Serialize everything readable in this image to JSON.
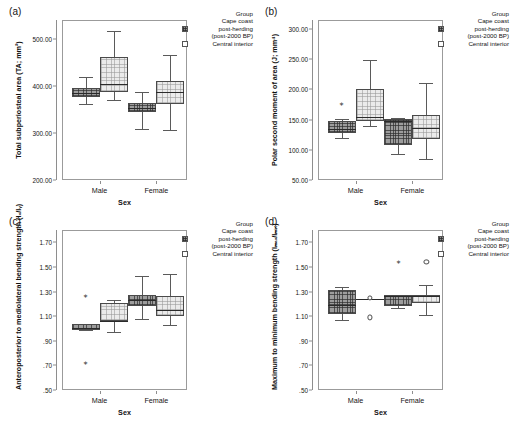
{
  "figure": {
    "legend": {
      "title": "Group",
      "entries": [
        {
          "label_line1": "Cape coast",
          "label_line2": "post-herding",
          "label_line3": "(post-2000 BP)",
          "swatch": "dark-hatched",
          "color": "#8f8f8f"
        },
        {
          "label_line1": "Central interior",
          "swatch": "light-open",
          "color": "#ffffff"
        }
      ]
    },
    "panels": [
      {
        "tag": "(a)",
        "ylabel": "Total subperiosteal area (TA; mm²)",
        "xlabel": "Sex",
        "yticks": [
          "200.00",
          "300.00",
          "400.00",
          "500.00"
        ],
        "xticks": [
          "Male",
          "Female"
        ]
      },
      {
        "tag": "(b)",
        "ylabel": "Polar second moment of area (J; mm⁴)",
        "xlabel": "Sex",
        "yticks": [
          "50.00",
          "100.00",
          "150.00",
          "200.00",
          "250.00",
          "300.00"
        ],
        "xticks": [
          "Male",
          "Female"
        ]
      },
      {
        "tag": "(c)",
        "ylabel": "Anteroposterior to mediolateral bending strength (Iₓ/Iᵧ)",
        "xlabel": "Sex",
        "yticks": [
          ".50",
          ".70",
          ".90",
          "1.10",
          "1.30",
          "1.50",
          "1.70"
        ],
        "xticks": [
          "Male",
          "Female"
        ]
      },
      {
        "tag": "(d)",
        "ylabel": "Maximum to minimum bending strength (Iₘₐₓ/Iₘᵢₙ)",
        "xlabel": "Sex",
        "yticks": [
          ".50",
          ".70",
          ".90",
          "1.10",
          "1.30",
          "1.50",
          "1.70"
        ],
        "xticks": [
          "Male",
          "Female"
        ]
      }
    ]
  },
  "chart_data": [
    {
      "type": "boxplot",
      "panel": "(a)",
      "title": "Total subperiosteal area",
      "ylabel": "Total subperiosteal area (TA; mm²)",
      "xlabel": "Sex",
      "ylim": [
        200,
        540
      ],
      "yticks": [
        200,
        300,
        400,
        500
      ],
      "categories": [
        "Male",
        "Female"
      ],
      "legend_position": "right",
      "grid": false,
      "series": [
        {
          "name": "Cape coast post-herding (post-2000 BP)",
          "boxes": [
            {
              "category": "Male",
              "whisker_low": 362,
              "q1": 377,
              "median": 385,
              "q3": 395,
              "whisker_high": 419,
              "outliers": []
            },
            {
              "category": "Female",
              "whisker_low": 309,
              "q1": 344,
              "median": 352,
              "q3": 364,
              "whisker_high": 388,
              "outliers": []
            }
          ]
        },
        {
          "name": "Central interior",
          "boxes": [
            {
              "category": "Male",
              "whisker_low": 369,
              "q1": 388,
              "median": 404,
              "q3": 461,
              "whisker_high": 516,
              "outliers": []
            },
            {
              "category": "Female",
              "whisker_low": 307,
              "q1": 362,
              "median": 387,
              "q3": 411,
              "whisker_high": 466,
              "outliers": []
            }
          ]
        }
      ]
    },
    {
      "type": "boxplot",
      "panel": "(b)",
      "title": "Polar second moment of area",
      "ylabel": "Polar second moment of area (J; mm⁴)",
      "xlabel": "Sex",
      "ylim": [
        50,
        315
      ],
      "yticks": [
        50,
        100,
        150,
        200,
        250,
        300
      ],
      "categories": [
        "Male",
        "Female"
      ],
      "legend_position": "right",
      "grid": false,
      "series": [
        {
          "name": "Cape coast post-herding (post-2000 BP)",
          "boxes": [
            {
              "category": "Male",
              "whisker_low": 119,
              "q1": 128,
              "median": 135,
              "q3": 147,
              "whisker_high": 151,
              "outliers": [
                176
              ]
            },
            {
              "category": "Female",
              "whisker_low": 93,
              "q1": 108,
              "median": 147,
              "q3": 151,
              "whisker_high": 152,
              "outliers": []
            }
          ]
        },
        {
          "name": "Central interior",
          "boxes": [
            {
              "category": "Male",
              "whisker_low": 140,
              "q1": 147,
              "median": 155,
              "q3": 201,
              "whisker_high": 249,
              "outliers": []
            },
            {
              "category": "Female",
              "whisker_low": 84,
              "q1": 118,
              "median": 136,
              "q3": 158,
              "whisker_high": 211,
              "outliers": []
            }
          ]
        }
      ]
    },
    {
      "type": "boxplot",
      "panel": "(c)",
      "title": "Anteroposterior to mediolateral bending strength",
      "ylabel": "Anteroposterior to mediolateral bending strength (Ix/Iy)",
      "xlabel": "Sex",
      "ylim": [
        0.5,
        1.8
      ],
      "yticks": [
        0.5,
        0.7,
        0.9,
        1.1,
        1.3,
        1.5,
        1.7
      ],
      "categories": [
        "Male",
        "Female"
      ],
      "legend_position": "right",
      "grid": false,
      "series": [
        {
          "name": "Cape coast post-herding (post-2000 BP)",
          "boxes": [
            {
              "category": "Male",
              "whisker_low": 0.99,
              "q1": 0.99,
              "median": 1.0,
              "q3": 1.04,
              "whisker_high": 1.04,
              "outliers": [
                1.26,
                0.72
              ]
            },
            {
              "category": "Female",
              "whisker_low": 1.08,
              "q1": 1.18,
              "median": 1.23,
              "q3": 1.27,
              "whisker_high": 1.43,
              "outliers": []
            }
          ]
        },
        {
          "name": "Central interior",
          "boxes": [
            {
              "category": "Male",
              "whisker_low": 0.97,
              "q1": 1.06,
              "median": 1.06,
              "q3": 1.21,
              "whisker_high": 1.23,
              "outliers": []
            },
            {
              "category": "Female",
              "whisker_low": 1.03,
              "q1": 1.1,
              "median": 1.15,
              "q3": 1.26,
              "whisker_high": 1.44,
              "outliers": []
            }
          ]
        }
      ]
    },
    {
      "type": "boxplot",
      "panel": "(d)",
      "title": "Maximum to minimum bending strength",
      "ylabel": "Maximum to minimum bending strength (Imax/Imin)",
      "xlabel": "Sex",
      "ylim": [
        0.5,
        1.8
      ],
      "yticks": [
        0.5,
        0.7,
        0.9,
        1.1,
        1.3,
        1.5,
        1.7
      ],
      "categories": [
        "Male",
        "Female"
      ],
      "legend_position": "right",
      "grid": false,
      "series": [
        {
          "name": "Cape coast post-herding (post-2000 BP)",
          "boxes": [
            {
              "category": "Male",
              "whisker_low": 1.07,
              "q1": 1.12,
              "median": 1.19,
              "q3": 1.31,
              "whisker_high": 1.34,
              "outliers": []
            },
            {
              "category": "Female",
              "whisker_low": 1.17,
              "q1": 1.18,
              "median": 1.26,
              "q3": 1.27,
              "whisker_high": 1.27,
              "outliers": [
                1.54
              ]
            }
          ]
        },
        {
          "name": "Central interior",
          "boxes": [
            {
              "category": "Male",
              "whisker_low": 1.24,
              "q1": 1.24,
              "median": 1.24,
              "q3": 1.24,
              "whisker_high": 1.24,
              "degenerate": true,
              "outliers": [
                1.25,
                1.09
              ]
            },
            {
              "category": "Female",
              "whisker_low": 1.11,
              "q1": 1.21,
              "median": 1.26,
              "q3": 1.27,
              "whisker_high": 1.35,
              "outliers": [
                1.54
              ]
            }
          ]
        }
      ]
    }
  ]
}
